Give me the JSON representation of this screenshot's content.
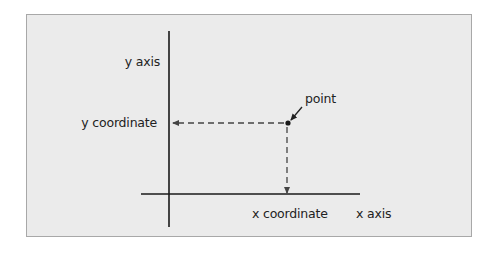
{
  "diagram": {
    "colors": {
      "background": "#ffffff",
      "panel": "#ebebeb",
      "panel_border": "#a8a8a8",
      "line": "#1a1a1a",
      "dashed": "#444444",
      "text": "#222222"
    },
    "labels": {
      "y_axis": "y axis",
      "x_axis": "x axis",
      "y_coordinate": "y coordinate",
      "x_coordinate": "x coordinate",
      "point": "point"
    },
    "geometry": {
      "y_axis_line": {
        "x": 169,
        "y1": 31,
        "y2": 227
      },
      "x_axis_line": {
        "y": 194,
        "x1": 141,
        "x2": 360
      },
      "point": {
        "x": 288,
        "y": 123
      },
      "horizontal_dashed": {
        "y": 123,
        "x_from": 286,
        "x_to": 172
      },
      "vertical_dashed": {
        "x": 287,
        "y_from": 126,
        "y_to": 194
      }
    }
  }
}
